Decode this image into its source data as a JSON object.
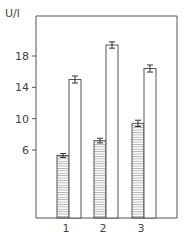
{
  "chart_data": {
    "type": "bar",
    "title": "",
    "xlabel": "",
    "ylabel": "U/l",
    "categories": [
      "1",
      "2",
      "3"
    ],
    "y_ticks": [
      6,
      10,
      14,
      18
    ],
    "ylim": [
      2,
      22
    ],
    "grid": false,
    "legend": null,
    "series": [
      {
        "name": "hatched",
        "pattern": "horizontal-lines",
        "values": [
          5.3,
          7.2,
          9.4
        ],
        "errors": [
          0.25,
          0.3,
          0.4
        ]
      },
      {
        "name": "open",
        "pattern": "none",
        "values": [
          15.0,
          19.4,
          16.4
        ],
        "errors": [
          0.45,
          0.4,
          0.45
        ]
      }
    ]
  },
  "axis": {
    "ylabel": "U/l"
  }
}
